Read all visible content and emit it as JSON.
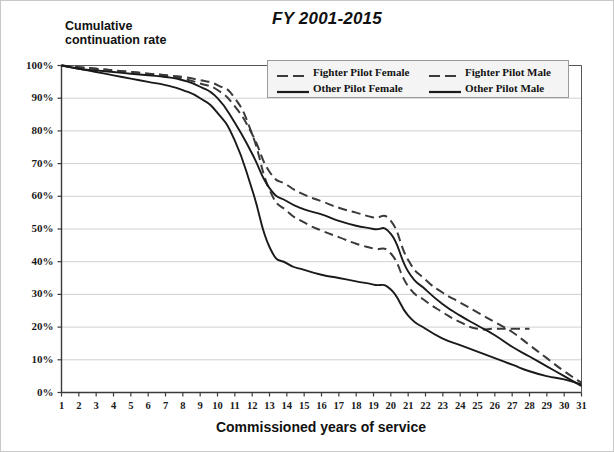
{
  "chart_data": {
    "type": "line",
    "title": "FY 2001-2015",
    "xlabel": "Commissioned years of service",
    "ylabel": "Cumulative\ncontinuation rate",
    "grid": true,
    "legend_position": "top-right-inside",
    "xlim": [
      1,
      31
    ],
    "ylim": [
      0,
      1
    ],
    "x": [
      1,
      2,
      3,
      4,
      5,
      6,
      7,
      8,
      9,
      10,
      11,
      12,
      13,
      14,
      15,
      16,
      17,
      18,
      19,
      20,
      21,
      22,
      23,
      24,
      25,
      26,
      27,
      28,
      29,
      30,
      31
    ],
    "xtick_labels": [
      "1",
      "2",
      "3",
      "4",
      "5",
      "6",
      "7",
      "8",
      "9",
      "10",
      "11",
      "12",
      "13",
      "14",
      "15",
      "16",
      "17",
      "18",
      "19",
      "20",
      "21",
      "22",
      "23",
      "24",
      "25",
      "26",
      "27",
      "28",
      "29",
      "30",
      "31"
    ],
    "ytick_labels": [
      "100%",
      "90%",
      "80%",
      "70%",
      "60%",
      "50%",
      "40%",
      "30%",
      "20%",
      "10%",
      "0%"
    ],
    "ytick_values": [
      1.0,
      0.9,
      0.8,
      0.7,
      0.6,
      0.5,
      0.4,
      0.3,
      0.2,
      0.1,
      0.0
    ],
    "series": [
      {
        "name": "Fighter Pilot Female",
        "style": "dashed",
        "color": "#3a3a3a",
        "values": [
          1.0,
          0.995,
          0.99,
          0.985,
          0.98,
          0.975,
          0.97,
          0.965,
          0.955,
          0.94,
          0.9,
          0.79,
          0.62,
          0.555,
          0.52,
          0.495,
          0.475,
          0.455,
          0.44,
          0.425,
          0.325,
          0.28,
          0.245,
          0.215,
          0.195,
          0.195,
          0.195,
          0.195,
          null,
          null,
          null
        ]
      },
      {
        "name": "Fighter Pilot Male",
        "style": "dashed",
        "color": "#3a3a3a",
        "values": [
          1.0,
          0.995,
          0.99,
          0.985,
          0.98,
          0.975,
          0.97,
          0.96,
          0.945,
          0.925,
          0.875,
          0.79,
          0.675,
          0.635,
          0.605,
          0.585,
          0.565,
          0.55,
          0.535,
          0.525,
          0.405,
          0.345,
          0.305,
          0.275,
          0.245,
          0.215,
          0.185,
          0.145,
          0.105,
          0.065,
          0.03
        ]
      },
      {
        "name": "Other Pilot Female",
        "style": "solid",
        "color": "#1a1a1a",
        "values": [
          1.0,
          0.99,
          0.98,
          0.97,
          0.96,
          0.95,
          0.94,
          0.925,
          0.9,
          0.855,
          0.77,
          0.62,
          0.445,
          0.395,
          0.375,
          0.36,
          0.35,
          0.34,
          0.33,
          0.315,
          0.235,
          0.195,
          0.165,
          0.145,
          0.125,
          0.105,
          0.085,
          0.065,
          0.05,
          0.04,
          0.025
        ]
      },
      {
        "name": "Other Pilot Male",
        "style": "solid",
        "color": "#1a1a1a",
        "values": [
          1.0,
          0.99,
          0.985,
          0.98,
          0.975,
          0.97,
          0.965,
          0.955,
          0.935,
          0.9,
          0.825,
          0.73,
          0.625,
          0.585,
          0.56,
          0.545,
          0.525,
          0.51,
          0.5,
          0.485,
          0.37,
          0.315,
          0.27,
          0.235,
          0.205,
          0.175,
          0.14,
          0.11,
          0.08,
          0.05,
          0.02
        ]
      }
    ]
  },
  "legend": {
    "items": [
      {
        "label": "Fighter Pilot Female",
        "style": "dashed"
      },
      {
        "label": "Fighter Pilot Male",
        "style": "dashed"
      },
      {
        "label": "Other Pilot Female",
        "style": "solid"
      },
      {
        "label": "Other Pilot Male",
        "style": "solid"
      }
    ]
  }
}
